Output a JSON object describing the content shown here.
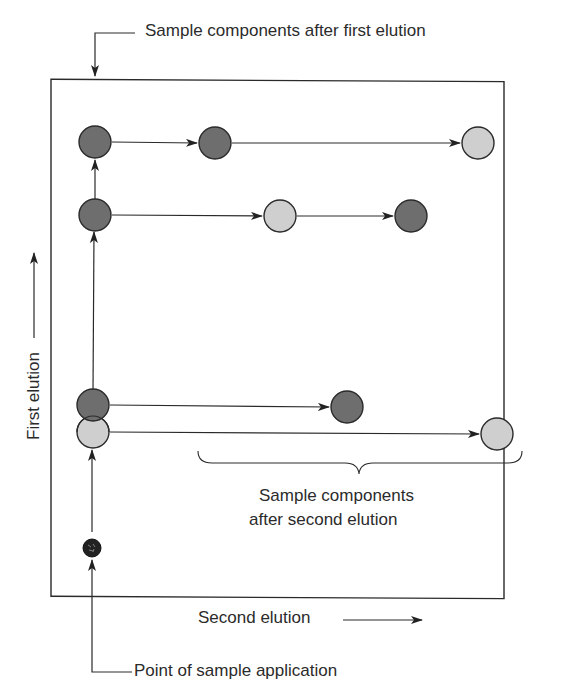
{
  "labels": {
    "top_callout": "Sample components after first elution",
    "y_axis": "First elution",
    "x_axis": "Second elution",
    "bracket_line1": "Sample components",
    "bracket_line2": "after second elution",
    "bottom_callout": "Point of sample application"
  },
  "colors": {
    "dark_spot": "#6e6e6e",
    "light_spot": "#cfcfcf",
    "origin_spot": "#222222",
    "stroke": "#2a2a2a"
  },
  "spots": {
    "origin": {
      "x": 92,
      "y": 548,
      "r": 9,
      "tone": "origin"
    },
    "first_elution": [
      {
        "x": 93,
        "y": 432,
        "tone": "light"
      },
      {
        "x": 93,
        "y": 405,
        "tone": "dark"
      },
      {
        "x": 95,
        "y": 215,
        "tone": "dark"
      },
      {
        "x": 95,
        "y": 142,
        "tone": "dark"
      }
    ],
    "second_elution": [
      {
        "x": 497,
        "y": 434,
        "tone": "light"
      },
      {
        "x": 347,
        "y": 407,
        "tone": "dark"
      },
      {
        "x": 280,
        "y": 216,
        "tone": "light"
      },
      {
        "x": 411,
        "y": 216,
        "tone": "dark"
      },
      {
        "x": 215,
        "y": 143,
        "tone": "dark"
      },
      {
        "x": 478,
        "y": 143,
        "tone": "light"
      }
    ]
  }
}
